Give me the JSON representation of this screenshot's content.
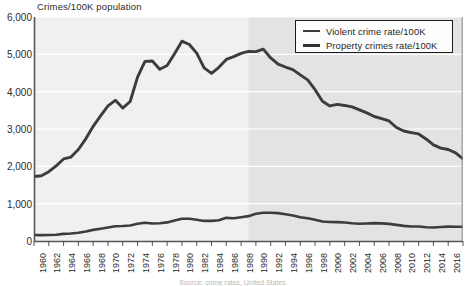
{
  "chart_data": {
    "type": "line",
    "title": "Crimes/100K population",
    "xlabel": "",
    "ylabel": "Crimes/100K population",
    "ylim": [
      0,
      6000
    ],
    "xlim": [
      1960,
      2018
    ],
    "grid": true,
    "legend_position": "top-right",
    "yticks": [
      "0",
      "1,000",
      "2,000",
      "3,000",
      "4,000",
      "5,000",
      "6,000"
    ],
    "ytick_values": [
      0,
      1000,
      2000,
      3000,
      4000,
      5000,
      6000
    ],
    "xticks": [
      "1960",
      "1962",
      "1964",
      "1966",
      "1968",
      "1970",
      "1972",
      "1974",
      "1976",
      "1978",
      "1980",
      "1982",
      "1984",
      "1986",
      "1988",
      "1990",
      "1992",
      "1994",
      "1996",
      "1998",
      "2000",
      "2002",
      "2004",
      "2006",
      "2008",
      "2010",
      "2012",
      "2014",
      "2016",
      "2018"
    ],
    "x": [
      1960,
      1961,
      1962,
      1963,
      1964,
      1965,
      1966,
      1967,
      1968,
      1969,
      1970,
      1971,
      1972,
      1973,
      1974,
      1975,
      1976,
      1977,
      1978,
      1979,
      1980,
      1981,
      1982,
      1983,
      1984,
      1985,
      1986,
      1987,
      1988,
      1989,
      1990,
      1991,
      1992,
      1993,
      1994,
      1995,
      1996,
      1997,
      1998,
      1999,
      2000,
      2001,
      2002,
      2003,
      2004,
      2005,
      2006,
      2007,
      2008,
      2009,
      2010,
      2011,
      2012,
      2013,
      2014,
      2015,
      2016,
      2017,
      2018
    ],
    "series": [
      {
        "name": "Violent crime rate/100K",
        "color": "#3c3c3c",
        "values": [
          161,
          158,
          162,
          168,
          190,
          200,
          220,
          254,
          298,
          329,
          364,
          396,
          401,
          417,
          461,
          488,
          468,
          476,
          498,
          549,
          597,
          594,
          571,
          538,
          539,
          557,
          620,
          610,
          637,
          666,
          730,
          758,
          758,
          747,
          714,
          685,
          637,
          611,
          568,
          523,
          507,
          505,
          494,
          476,
          463,
          469,
          479,
          472,
          458,
          432,
          405,
          387,
          387,
          370,
          362,
          373,
          386,
          383,
          381
        ]
      },
      {
        "name": "Property crimes rate/100K",
        "color": "#3c3c3c",
        "values": [
          1726,
          1747,
          1857,
          2012,
          2198,
          2249,
          2451,
          2736,
          3071,
          3351,
          3621,
          3769,
          3561,
          3737,
          4389,
          4811,
          4820,
          4602,
          4703,
          5017,
          5353,
          5264,
          5033,
          4637,
          4492,
          4651,
          4863,
          4940,
          5027,
          5078,
          5073,
          5140,
          4903,
          4740,
          4660,
          4591,
          4451,
          4316,
          4053,
          3744,
          3618,
          3658,
          3631,
          3591,
          3514,
          3432,
          3335,
          3276,
          3215,
          3041,
          2946,
          2905,
          2868,
          2734,
          2574,
          2487,
          2451,
          2362,
          2200
        ]
      }
    ],
    "shaded_region": {
      "from": 1989,
      "to": 2018,
      "note": "darker background band"
    }
  },
  "footnote": "Source: crime rates, United States"
}
